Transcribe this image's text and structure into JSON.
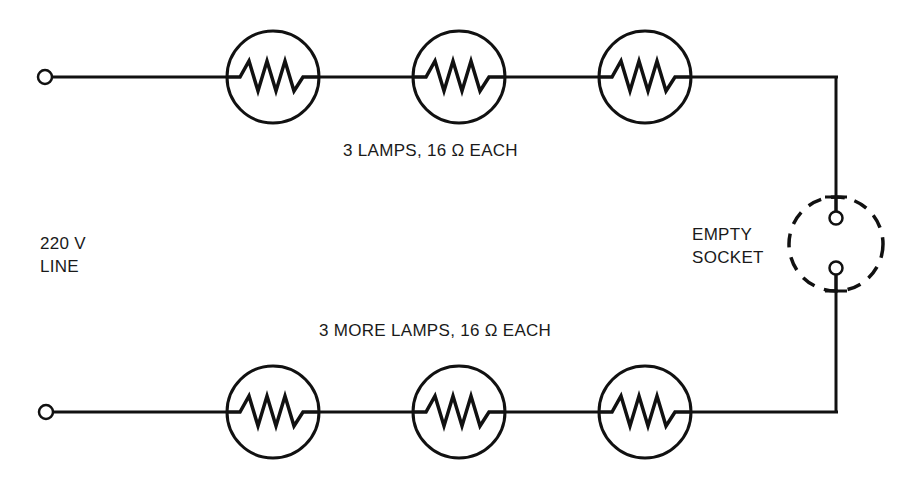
{
  "diagram": {
    "type": "series circuit",
    "labels": {
      "top_group": "3 LAMPS, 16 Ω  EACH",
      "bottom_group": "3 MORE LAMPS, 16 Ω EACH",
      "source_line1": "220 V",
      "source_line2": "LINE",
      "socket_line1": "EMPTY",
      "socket_line2": "SOCKET"
    },
    "components": {
      "top_lamps": [
        {
          "id": "lamp-1",
          "resistance": "16 Ω"
        },
        {
          "id": "lamp-2",
          "resistance": "16 Ω"
        },
        {
          "id": "lamp-3",
          "resistance": "16 Ω"
        }
      ],
      "bottom_lamps": [
        {
          "id": "lamp-4",
          "resistance": "16 Ω"
        },
        {
          "id": "lamp-5",
          "resistance": "16 Ω"
        },
        {
          "id": "lamp-6",
          "resistance": "16 Ω"
        }
      ],
      "socket": {
        "state": "empty"
      },
      "terminals": [
        "top-terminal",
        "bottom-terminal"
      ]
    },
    "colors": {
      "ink": "#111111",
      "background": "#ffffff"
    }
  }
}
